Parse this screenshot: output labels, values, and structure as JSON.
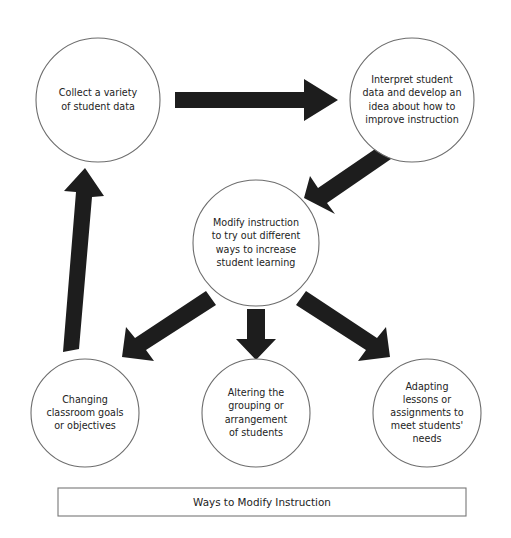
{
  "figure": {
    "caption": "Ways to Modify Instruction",
    "colors": {
      "arrow": "#1d1d1d",
      "circle_stroke": "#6d6d6d",
      "text": "#232323",
      "background": "#ffffff",
      "caption_border": "#777777"
    }
  },
  "nodes": [
    {
      "id": "collect-data",
      "lines": [
        "Collect a variety",
        "of student data"
      ],
      "cx": 98,
      "cy": 100,
      "r": 62
    },
    {
      "id": "interpret-data",
      "lines": [
        "Interpret student",
        "data and develop an",
        "idea about how to",
        "improve instruction"
      ],
      "cx": 412,
      "cy": 100,
      "r": 62
    },
    {
      "id": "modify-instruction",
      "lines": [
        "Modify instruction",
        "to try out different",
        "ways to increase",
        "student learning"
      ],
      "cx": 256,
      "cy": 243,
      "r": 63
    },
    {
      "id": "changing-goals",
      "lines": [
        "Changing",
        "classroom goals",
        "or objectives"
      ],
      "cx": 85,
      "cy": 413,
      "r": 54
    },
    {
      "id": "altering-grouping",
      "lines": [
        "Altering the",
        "grouping or",
        "arrangement",
        "of students"
      ],
      "cx": 256,
      "cy": 413,
      "r": 54
    },
    {
      "id": "adapting-lessons",
      "lines": [
        "Adapting",
        "lessons or",
        "assignments to",
        "meet students'",
        "needs"
      ],
      "cx": 427,
      "cy": 413,
      "r": 54
    }
  ],
  "arrows": [
    {
      "id": "collect-to-interpret",
      "from": "collect-data",
      "to": "interpret-data",
      "direction": "right",
      "points": "175,92 304,92 304,79 338,100 304,121 304,108 175,108"
    },
    {
      "id": "interpret-to-modify",
      "from": "interpret-data",
      "to": "modify-instruction",
      "direction": "down-left",
      "points": "381,145 391,159 327,203 335,214 304,198 310,176 318,188"
    },
    {
      "id": "modify-to-changing",
      "from": "modify-instruction",
      "to": "changing-goals",
      "direction": "down-left",
      "points": "206,291 216,305 146,350 154,361 122,357 126,327 135,338"
    },
    {
      "id": "modify-to-altering",
      "from": "modify-instruction",
      "to": "altering-grouping",
      "direction": "down",
      "points": "247,309 265,309 265,339 276,339 256,360 236,339 247,339"
    },
    {
      "id": "modify-to-adapting",
      "from": "modify-instruction",
      "to": "adapting-lessons",
      "direction": "down-right",
      "points": "306,291 296,305 366,350 358,361 390,357 386,327 377,338"
    },
    {
      "id": "changing-to-collect",
      "from": "changing-goals",
      "to": "collect-data",
      "direction": "up",
      "points": "63,352 79,349 92,197 104,196 85,168 64,191 76,192"
    }
  ],
  "caption_box": {
    "x": 58,
    "y": 488,
    "width": 408,
    "height": 28
  }
}
